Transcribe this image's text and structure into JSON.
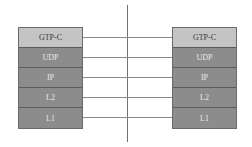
{
  "diagram": {
    "type": "protocol-stack",
    "left_stack": {
      "layers": [
        "GTP-C",
        "UDP",
        "IP",
        "L2",
        "L1"
      ]
    },
    "right_stack": {
      "layers": [
        "GTP-C",
        "UDP",
        "IP",
        "L2",
        "L1"
      ]
    },
    "colors": {
      "top_layer": "#c4c4c4",
      "lower_layers": "#8c8c8c",
      "divider": "#707070"
    }
  }
}
